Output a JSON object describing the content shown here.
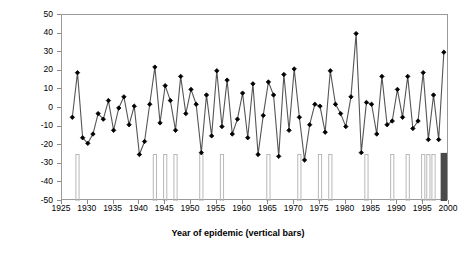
{
  "chart_data": {
    "type": "line",
    "title": "",
    "xlabel": "Year of epidemic (vertical bars)",
    "ylabel": "SOI couplet difference",
    "xlim": [
      1925,
      2000
    ],
    "ylim": [
      -50,
      50
    ],
    "xticks": [
      1925,
      1930,
      1935,
      1940,
      1945,
      1950,
      1955,
      1960,
      1965,
      1970,
      1975,
      1980,
      1985,
      1990,
      1995,
      2000
    ],
    "yticks": [
      -50,
      -40,
      -30,
      -20,
      -10,
      0,
      10,
      20,
      30,
      40,
      50
    ],
    "grid": false,
    "legend": "none",
    "series": [
      {
        "name": "SOI couplet difference",
        "marker": "diamond",
        "color": "#000000",
        "line_color": "#555555",
        "x": [
          1927,
          1928,
          1929,
          1930,
          1931,
          1932,
          1933,
          1934,
          1935,
          1936,
          1937,
          1938,
          1939,
          1940,
          1941,
          1942,
          1943,
          1944,
          1945,
          1946,
          1947,
          1948,
          1949,
          1950,
          1951,
          1952,
          1953,
          1954,
          1955,
          1956,
          1957,
          1958,
          1959,
          1960,
          1961,
          1962,
          1963,
          1964,
          1965,
          1966,
          1967,
          1968,
          1969,
          1970,
          1971,
          1972,
          1973,
          1974,
          1975,
          1976,
          1977,
          1978,
          1979,
          1980,
          1981,
          1982,
          1983,
          1984,
          1985,
          1986,
          1987,
          1988,
          1989,
          1990,
          1991,
          1992,
          1993,
          1994,
          1995,
          1996,
          1997,
          1998,
          1999
        ],
        "y": [
          -5,
          19,
          -16,
          -19,
          -14,
          -3,
          -6,
          4,
          -12,
          0,
          6,
          -9,
          1,
          -25,
          -18,
          2,
          22,
          -8,
          12,
          4,
          -12,
          17,
          -3,
          10,
          2,
          -24,
          7,
          -15,
          20,
          -10,
          15,
          -14,
          -6,
          8,
          -16,
          13,
          -25,
          -4,
          14,
          7,
          -26,
          18,
          -12,
          21,
          -5,
          -28,
          -9,
          2,
          1,
          -13,
          20,
          2,
          -3,
          -10,
          6,
          40,
          -24,
          3,
          2,
          -14,
          17,
          -9,
          -7,
          10,
          -5,
          17,
          -11,
          -7,
          19,
          -17,
          7,
          -17,
          30
        ]
      }
    ],
    "bars": {
      "name": "Year of epidemic",
      "description": "vertical bars marking epidemic years, drawn from -50 to -25",
      "color": "#b8b8b8",
      "bottom": -50,
      "top": -25,
      "years": [
        1928,
        1943,
        1945,
        1947,
        1952,
        1956,
        1965,
        1971,
        1975,
        1977,
        1984,
        1989,
        1992,
        1995,
        1996,
        1997,
        1999
      ],
      "highlight_year": 1999,
      "highlight_color": "#4a4a4a"
    }
  }
}
